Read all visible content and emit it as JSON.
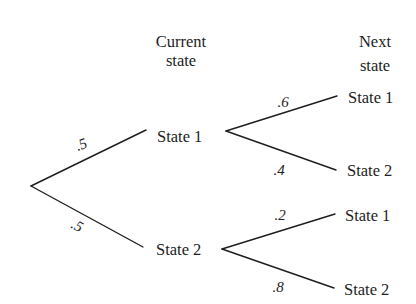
{
  "headers": {
    "current": {
      "line1": "Current",
      "line2": "state"
    },
    "next": {
      "line1": "Next",
      "line2": "state"
    }
  },
  "current_states": [
    {
      "label": "State 1",
      "prob_from_root": ".5"
    },
    {
      "label": "State 2",
      "prob_from_root": ".5"
    }
  ],
  "next_states": [
    {
      "parent": "State 1",
      "label": "State 1",
      "prob": ".6"
    },
    {
      "parent": "State 1",
      "label": "State 2",
      "prob": ".4"
    },
    {
      "parent": "State 2",
      "label": "State 1",
      "prob": ".2"
    },
    {
      "parent": "State 2",
      "label": "State 2",
      "prob": ".8"
    }
  ],
  "colors": {
    "ink": "#1e1e1e",
    "background": "#ffffff"
  }
}
